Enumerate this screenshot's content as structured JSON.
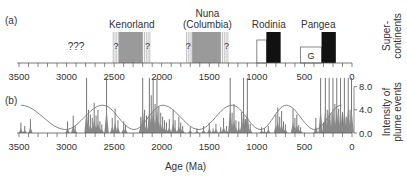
{
  "chart_data": [
    {
      "panel": "(a)",
      "type": "timeline",
      "title": "",
      "xlabel": "",
      "ylabel": "Super-\ncontinents",
      "ylabel_lines": [
        "Super-",
        "continents"
      ],
      "xlim": [
        3500,
        0
      ],
      "x_ticks": [
        3500,
        3000,
        2500,
        2000,
        1500,
        1000,
        500,
        0
      ],
      "annotations": [
        {
          "text": "???",
          "x": 2900
        }
      ],
      "supercontinents": [
        {
          "name": "Kenorland",
          "name_lines": [
            "Kenorland"
          ],
          "core": [
            2450,
            2200
          ],
          "uncertain_left": [
            2510,
            2450
          ],
          "uncertain_right": [
            2200,
            2120
          ],
          "fill": "#9a9a9a",
          "question_marks": [
            2480,
            2150
          ]
        },
        {
          "name": "Nuna (Columbia)",
          "name_lines": [
            "Nuna",
            "(Columbia)"
          ],
          "core": [
            1680,
            1380
          ],
          "uncertain_left": [
            1740,
            1680
          ],
          "uncertain_right": [
            1380,
            1300
          ],
          "fill": "#9a9a9a",
          "question_marks": [
            1720,
            1320
          ]
        },
        {
          "name": "Rodinia",
          "name_lines": [
            "Rodinia"
          ],
          "core": [
            900,
            750
          ],
          "precursor": [
            1000,
            900
          ],
          "fill": "#111111"
        },
        {
          "name": "Pangea",
          "name_lines": [
            "Pangea"
          ],
          "core": [
            320,
            170
          ],
          "precursor": [
            540,
            320
          ],
          "precursor_label": "G",
          "fill": "#111111"
        }
      ]
    },
    {
      "panel": "(b)",
      "type": "bar",
      "xlabel": "Age (Ma)",
      "ylabel": "Intensity of\nplume events",
      "ylabel_lines": [
        "Intensity of",
        "plume events"
      ],
      "xlim": [
        3500,
        0
      ],
      "ylim": [
        0,
        8
      ],
      "x_ticks": [
        3500,
        3000,
        2500,
        2000,
        1500,
        1000,
        500,
        0
      ],
      "y_ticks": [
        "0.0",
        "4.0",
        "8.0"
      ],
      "grid": false,
      "cycle_curve": {
        "description": "sinusoidal supercontinent cycle envelope",
        "peaks_ma": [
          3480,
          2620,
          1990,
          1260,
          690,
          110
        ],
        "troughs_ma": [
          3010,
          2290,
          1610,
          960,
          390
        ],
        "peak_value": 4.8,
        "trough_value": 0.6
      },
      "spikes": [
        [
          3480,
          1.8
        ],
        [
          3440,
          1.2
        ],
        [
          3380,
          2.4
        ],
        [
          2990,
          2.0
        ],
        [
          2930,
          3.0
        ],
        [
          2910,
          1.2
        ],
        [
          2790,
          9.5
        ],
        [
          2770,
          4.0
        ],
        [
          2750,
          3.2
        ],
        [
          2730,
          2.6
        ],
        [
          2710,
          5.2
        ],
        [
          2690,
          3.0
        ],
        [
          2670,
          4.0
        ],
        [
          2650,
          2.0
        ],
        [
          2630,
          1.5
        ],
        [
          2580,
          9.5
        ],
        [
          2520,
          2.6
        ],
        [
          2490,
          4.2
        ],
        [
          2460,
          2.2
        ],
        [
          2400,
          2.0
        ],
        [
          2380,
          1.4
        ],
        [
          2220,
          2.8
        ],
        [
          2200,
          9.5
        ],
        [
          2180,
          4.0
        ],
        [
          2160,
          3.0
        ],
        [
          2130,
          9.5
        ],
        [
          2110,
          6.5
        ],
        [
          2090,
          9.5
        ],
        [
          2070,
          5.0
        ],
        [
          2050,
          9.5
        ],
        [
          2030,
          4.5
        ],
        [
          2010,
          3.5
        ],
        [
          1990,
          2.8
        ],
        [
          1970,
          2.2
        ],
        [
          1950,
          1.8
        ],
        [
          1920,
          2.4
        ],
        [
          1880,
          4.0
        ],
        [
          1860,
          2.2
        ],
        [
          1820,
          2.8
        ],
        [
          1800,
          1.8
        ],
        [
          1780,
          1.2
        ],
        [
          1700,
          1.0
        ],
        [
          1630,
          0.8
        ],
        [
          1560,
          1.2
        ],
        [
          1500,
          1.8
        ],
        [
          1460,
          0.8
        ],
        [
          1430,
          1.6
        ],
        [
          1380,
          1.0
        ],
        [
          1350,
          2.6
        ],
        [
          1320,
          1.2
        ],
        [
          1280,
          9.5
        ],
        [
          1260,
          3.5
        ],
        [
          1240,
          5.0
        ],
        [
          1220,
          2.2
        ],
        [
          1190,
          2.0
        ],
        [
          1160,
          3.6
        ],
        [
          1140,
          9.5
        ],
        [
          1120,
          2.4
        ],
        [
          1100,
          9.5
        ],
        [
          1070,
          1.6
        ],
        [
          950,
          1.0
        ],
        [
          920,
          0.8
        ],
        [
          880,
          1.2
        ],
        [
          800,
          3.2
        ],
        [
          780,
          4.4
        ],
        [
          760,
          2.8
        ],
        [
          740,
          3.8
        ],
        [
          720,
          2.0
        ],
        [
          700,
          1.5
        ],
        [
          620,
          4.2
        ],
        [
          600,
          2.6
        ],
        [
          580,
          3.2
        ],
        [
          560,
          1.4
        ],
        [
          540,
          1.0
        ],
        [
          380,
          2.6
        ],
        [
          330,
          9.5
        ],
        [
          300,
          1.8
        ],
        [
          280,
          9.5
        ],
        [
          260,
          4.0
        ],
        [
          240,
          9.5
        ],
        [
          220,
          3.4
        ],
        [
          200,
          9.5
        ],
        [
          180,
          5.0
        ],
        [
          160,
          9.5
        ],
        [
          140,
          4.2
        ],
        [
          120,
          9.5
        ],
        [
          100,
          3.6
        ],
        [
          80,
          9.5
        ],
        [
          60,
          2.8
        ],
        [
          40,
          9.5
        ],
        [
          20,
          4.0
        ],
        [
          5,
          9.5
        ]
      ]
    }
  ],
  "labels": {
    "panel_a": "(a)",
    "panel_b": "(b)",
    "unknown": "???",
    "xlabel": "Age (Ma)"
  }
}
